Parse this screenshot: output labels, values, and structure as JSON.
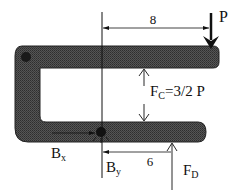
{
  "diagram": {
    "type": "free-body diagram",
    "labels": {
      "P": "P",
      "dim_top": "8",
      "dim_bottom": "6",
      "Fc_main": "F",
      "Fc_sub": "C",
      "Fc_value": "=3/2 P",
      "Bx_main": "B",
      "Bx_sub": "x",
      "By_main": "B",
      "By_sub": "y",
      "FD_main": "F",
      "FD_sub": "D"
    },
    "colors": {
      "member_fill": "#4a4a4a",
      "line": "#111111",
      "background": "#ffffff"
    }
  }
}
